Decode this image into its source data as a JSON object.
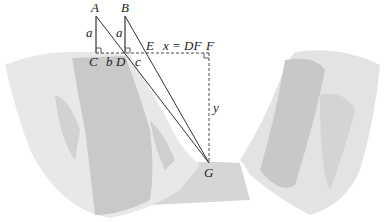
{
  "diagram": {
    "points": {
      "A": {
        "label": "A",
        "x": 96,
        "y": 16
      },
      "B": {
        "label": "B",
        "x": 125,
        "y": 16
      },
      "C": {
        "label": "C",
        "x": 96,
        "y": 53
      },
      "D": {
        "label": "D",
        "x": 125,
        "y": 53
      },
      "E": {
        "label": "E",
        "x": 147,
        "y": 53
      },
      "F": {
        "label": "F",
        "x": 209,
        "y": 53
      },
      "G": {
        "label": "G",
        "x": 209,
        "y": 163
      }
    },
    "segment_labels": {
      "a_left": "a",
      "a_right": "a",
      "b": "b",
      "c": "c",
      "x_eq": "x = DF",
      "y": "y"
    },
    "colors": {
      "line": "#333333",
      "cliff_light": "#e6e6e6",
      "cliff_mid": "#cfcfcf",
      "cliff_dark": "#b5b5b5",
      "ground": "#d3d3d3"
    }
  }
}
